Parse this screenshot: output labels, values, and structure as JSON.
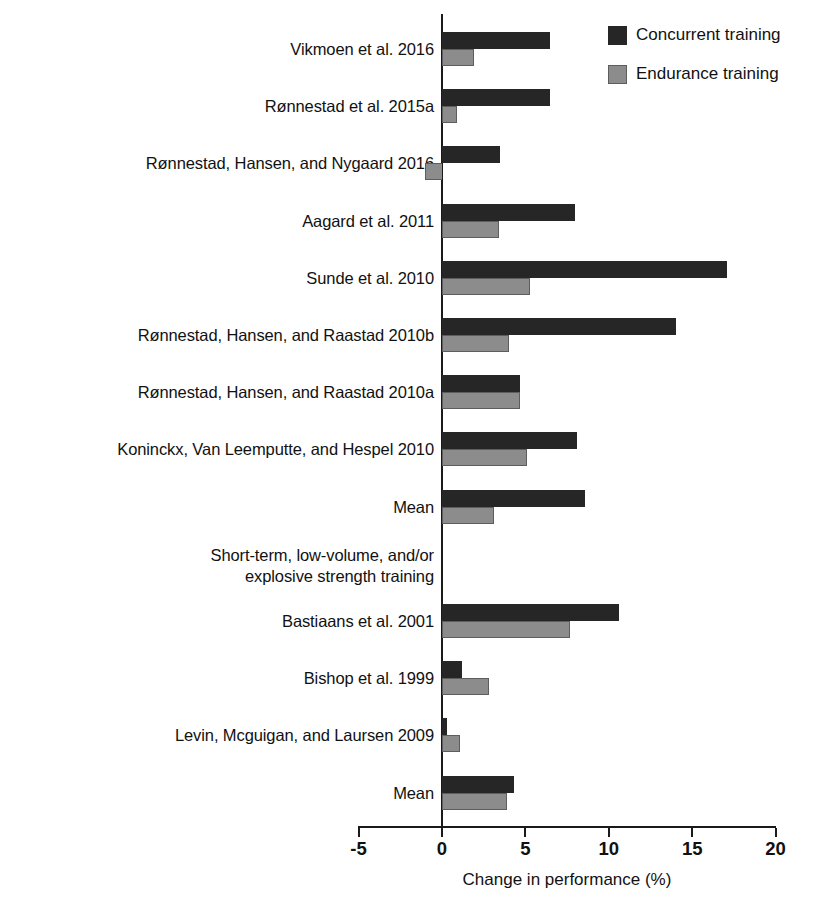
{
  "chart_data": {
    "type": "bar",
    "orientation": "horizontal",
    "title": "",
    "xlabel": "Change in performance (%)",
    "ylabel": "",
    "xlim": [
      -5,
      20
    ],
    "xticks": [
      -5,
      0,
      5,
      10,
      15,
      20
    ],
    "xtick_labels": [
      "-5",
      "0",
      "5",
      "10",
      "15",
      "20"
    ],
    "grid": false,
    "legend_position": "top-right",
    "series": [
      {
        "name": "Concurrent training",
        "color": "#262626",
        "values": [
          6.5,
          6.5,
          3.5,
          8.0,
          17.1,
          14.0,
          4.7,
          8.1,
          8.6,
          null,
          10.6,
          1.2,
          0.3,
          4.3
        ]
      },
      {
        "name": "Endurance training",
        "color": "#8c8c8c",
        "values": [
          1.9,
          0.9,
          -1.0,
          3.4,
          5.3,
          4.0,
          4.7,
          5.1,
          3.1,
          null,
          7.7,
          2.8,
          1.1,
          3.9
        ]
      }
    ],
    "categories": [
      "Vikmoen et al. 2016",
      "Rønnestad et al. 2015a",
      "Rønnestad, Hansen, and Nygaard 2016",
      "Aagard et al. 2011",
      "Sunde et al. 2010",
      "Rønnestad, Hansen, and Raastad 2010b",
      "Rønnestad, Hansen, and Raastad 2010a",
      "Koninckx, Van Leemputte, and Hespel 2010",
      "Mean",
      "Short-term, low-volume, and/or\nexplosive strength training",
      "Bastiaans et al. 2001",
      "Bishop et al. 1999",
      "Levin, Mcguigan, and Laursen 2009",
      "Mean"
    ]
  },
  "legend": {
    "items": [
      {
        "label": "Concurrent training",
        "swatch": "concurrent"
      },
      {
        "label": "Endurance training",
        "swatch": "endurance"
      }
    ]
  },
  "axis": {
    "title": "Change in performance (%)",
    "ticks": [
      {
        "label": "-5",
        "value": -5
      },
      {
        "label": "0",
        "value": 0
      },
      {
        "label": "5",
        "value": 5
      },
      {
        "label": "10",
        "value": 10
      },
      {
        "label": "15",
        "value": 15
      },
      {
        "label": "20",
        "value": 20
      }
    ]
  },
  "rows": [
    {
      "label": "Vikmoen et al. 2016",
      "concurrent": 6.5,
      "endurance": 1.9,
      "header": false
    },
    {
      "label": "Rønnestad et al. 2015a",
      "concurrent": 6.5,
      "endurance": 0.9,
      "header": false
    },
    {
      "label": "Rønnestad, Hansen, and Nygaard 2016",
      "concurrent": 3.5,
      "endurance": -1.0,
      "header": false
    },
    {
      "label": "Aagard et al. 2011",
      "concurrent": 8.0,
      "endurance": 3.4,
      "header": false
    },
    {
      "label": "Sunde et al. 2010",
      "concurrent": 17.1,
      "endurance": 5.3,
      "header": false
    },
    {
      "label": "Rønnestad, Hansen, and Raastad 2010b",
      "concurrent": 14.0,
      "endurance": 4.0,
      "header": false
    },
    {
      "label": "Rønnestad, Hansen, and Raastad 2010a",
      "concurrent": 4.7,
      "endurance": 4.7,
      "header": false
    },
    {
      "label": "Koninckx, Van Leemputte, and Hespel 2010",
      "concurrent": 8.1,
      "endurance": 5.1,
      "header": false
    },
    {
      "label": "Mean",
      "concurrent": 8.6,
      "endurance": 3.1,
      "header": false
    },
    {
      "label": "Short-term, low-volume, and/or\nexplosive strength training",
      "concurrent": null,
      "endurance": null,
      "header": true
    },
    {
      "label": "Bastiaans et al. 2001",
      "concurrent": 10.6,
      "endurance": 7.7,
      "header": false
    },
    {
      "label": "Bishop et al. 1999",
      "concurrent": 1.2,
      "endurance": 2.8,
      "header": false
    },
    {
      "label": "Levin, Mcguigan, and Laursen 2009",
      "concurrent": 0.3,
      "endurance": 1.1,
      "header": false
    },
    {
      "label": "Mean",
      "concurrent": 4.3,
      "endurance": 3.9,
      "header": false
    }
  ]
}
